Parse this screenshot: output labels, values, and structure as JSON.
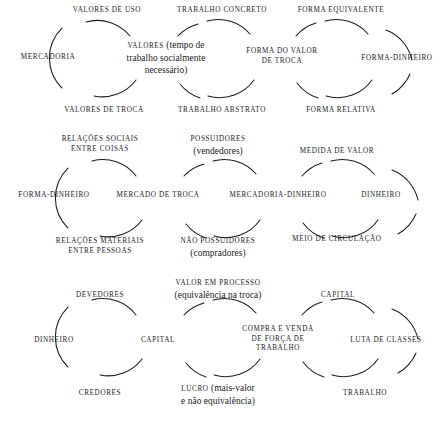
{
  "figure": {
    "language": "pt-BR",
    "background_color": "#ffffff",
    "ink_color": "#1a1a1a",
    "width": 441,
    "height": 438
  },
  "nodes": [
    {
      "id": "n-valores-de-uso",
      "style": "caps",
      "lines": [
        "Valores de uso"
      ],
      "x": 107,
      "y": 11
    },
    {
      "id": "n-trabalho-concreto",
      "style": "caps",
      "lines": [
        "Trabalho concreto"
      ],
      "x": 222,
      "y": 11
    },
    {
      "id": "n-forma-equivalente",
      "style": "caps",
      "lines": [
        "Forma equivalente"
      ],
      "x": 341,
      "y": 11
    },
    {
      "id": "n-mercadoria",
      "style": "caps",
      "lines": [
        "Mercadoria"
      ],
      "x": 48,
      "y": 58
    },
    {
      "id": "n-valores-tempo",
      "style": "mix",
      "lines_rich": [
        [
          {
            "t": "Valores",
            "sc": true
          },
          {
            "t": " (tempo de",
            "sc": false
          }
        ],
        [
          {
            "t": "trabalho socialmente",
            "sc": false
          }
        ],
        [
          {
            "t": "necessário)",
            "sc": false
          }
        ]
      ],
      "x": 166,
      "y": 58
    },
    {
      "id": "n-forma-do-valor-de-troca",
      "style": "caps",
      "lines": [
        "Forma do valor",
        "de troca"
      ],
      "x": 282,
      "y": 56
    },
    {
      "id": "n-forma-dinheiro-1",
      "style": "caps",
      "lines": [
        "Forma-dinheiro"
      ],
      "x": 397,
      "y": 59
    },
    {
      "id": "n-valores-de-troca",
      "style": "caps",
      "lines": [
        "Valores de troca"
      ],
      "x": 104,
      "y": 111
    },
    {
      "id": "n-trabalho-abstrato",
      "style": "caps",
      "lines": [
        "Trabalho abstrato"
      ],
      "x": 222,
      "y": 111
    },
    {
      "id": "n-forma-relativa",
      "style": "caps",
      "lines": [
        "Forma relativa"
      ],
      "x": 341,
      "y": 111
    },
    {
      "id": "n-relacoes-sociais",
      "style": "caps",
      "lines": [
        "Relações sociais",
        "entre coisas"
      ],
      "x": 100,
      "y": 144
    },
    {
      "id": "n-possuidores",
      "style": "mix",
      "lines_rich": [
        [
          {
            "t": "Possuidores",
            "sc": true
          }
        ],
        [
          {
            "t": "(vendedores)",
            "sc": false
          }
        ]
      ],
      "x": 218,
      "y": 144
    },
    {
      "id": "n-medida-de-valor",
      "style": "caps",
      "lines": [
        "Medida de valor"
      ],
      "x": 337,
      "y": 152
    },
    {
      "id": "n-forma-dinheiro-2",
      "style": "caps",
      "lines": [
        "Forma-dinheiro"
      ],
      "x": 54,
      "y": 196
    },
    {
      "id": "n-mercado-de-troca",
      "style": "caps",
      "lines": [
        "Mercado de troca"
      ],
      "x": 158,
      "y": 196
    },
    {
      "id": "n-mercadoria-dinheiro",
      "style": "caps",
      "lines": [
        "Mercadoria-dinheiro"
      ],
      "x": 278,
      "y": 196
    },
    {
      "id": "n-dinheiro-1",
      "style": "caps",
      "lines": [
        "Dinheiro"
      ],
      "x": 381,
      "y": 196
    },
    {
      "id": "n-relacoes-materiais",
      "style": "caps",
      "lines": [
        "Relações materiais",
        "entre pessoas"
      ],
      "x": 100,
      "y": 246
    },
    {
      "id": "n-nao-possuidores",
      "style": "mix",
      "lines_rich": [
        [
          {
            "t": "Não possuidores",
            "sc": true
          }
        ],
        [
          {
            "t": "(compradores)",
            "sc": false
          }
        ]
      ],
      "x": 218,
      "y": 246
    },
    {
      "id": "n-meio-de-circulacao",
      "style": "caps",
      "lines": [
        "Meio de circulação"
      ],
      "x": 337,
      "y": 240
    },
    {
      "id": "n-valor-em-processo",
      "style": "mix",
      "lines_rich": [
        [
          {
            "t": "Valor em processo",
            "sc": true
          }
        ],
        [
          {
            "t": "(equivalência na troca)",
            "sc": false
          }
        ]
      ],
      "x": 218,
      "y": 288
    },
    {
      "id": "n-devedores",
      "style": "caps",
      "lines": [
        "Devedores"
      ],
      "x": 100,
      "y": 296
    },
    {
      "id": "n-capital-top",
      "style": "caps",
      "lines": [
        "Capital"
      ],
      "x": 338,
      "y": 296
    },
    {
      "id": "n-dinheiro-2",
      "style": "caps",
      "lines": [
        "Dinheiro"
      ],
      "x": 54,
      "y": 341
    },
    {
      "id": "n-capital-mid",
      "style": "caps",
      "lines": [
        "Capital"
      ],
      "x": 158,
      "y": 341
    },
    {
      "id": "n-compra-e-venda",
      "style": "caps",
      "lines": [
        "Compra e venda",
        "de força de",
        "trabalho"
      ],
      "x": 278,
      "y": 339
    },
    {
      "id": "n-luta-de-classes",
      "style": "caps",
      "lines": [
        "Luta de classes"
      ],
      "x": 386,
      "y": 341
    },
    {
      "id": "n-credores",
      "style": "caps",
      "lines": [
        "Credores"
      ],
      "x": 100,
      "y": 394
    },
    {
      "id": "n-lucro",
      "style": "mix",
      "lines_rich": [
        [
          {
            "t": "Lucro",
            "sc": true
          },
          {
            "t": " (mais-valor",
            "sc": false
          }
        ],
        [
          {
            "t": "e não equivalência)",
            "sc": false
          }
        ]
      ],
      "x": 218,
      "y": 394
    },
    {
      "id": "n-trabalho",
      "style": "caps",
      "lines": [
        "Trabalho"
      ],
      "x": 365,
      "y": 394
    }
  ],
  "arcs": {
    "stroke_color": "#1a1a1a",
    "stroke_width": 1.05,
    "paths": [
      "M 62 88 A 42 42 0 0 1 62 28",
      "M 86 22 A 42 42 0 0 1 130 36",
      "M 136 80 A 42 42 0 0 1 94 96",
      "M 178 36 A 42 42 0 0 1 198 24",
      "M 207 21 A 42 42 0 0 1 250 34",
      "M 254 80 A 42 42 0 0 1 208 96",
      "M 200 98 A 42 42 0 0 1 180 84",
      "M 296 36 A 42 42 0 0 1 316 23",
      "M 325 21 A 42 42 0 0 1 368 34",
      "M 372 80 A 42 42 0 0 1 326 96",
      "M 318 98 A 42 42 0 0 1 297 83",
      "M 386 30 A 42 42 0 0 1 412 60",
      "M 410 74 A 42 42 0 0 1 392 94",
      "M 68 228 A 42 42 0 0 1 68 168",
      "M 92 161 A 42 42 0 0 1 136 176",
      "M 142 220 A 42 42 0 0 1 100 236",
      "M 184 176 A 42 42 0 0 1 204 164",
      "M 213 161 A 42 42 0 0 1 256 174",
      "M 260 220 A 42 42 0 0 1 214 236",
      "M 206 238 A 42 42 0 0 1 186 224",
      "M 302 176 A 42 42 0 0 1 322 163",
      "M 331 161 A 42 42 0 0 1 374 174",
      "M 378 220 A 42 42 0 0 1 332 236",
      "M 324 238 A 42 42 0 0 1 303 223",
      "M 392 170 A 42 42 0 0 1 418 200",
      "M 416 214 A 42 42 0 0 1 398 234",
      "M 68 367 A 42 42 0 0 1 68 307",
      "M 92 300 A 42 42 0 0 1 136 315",
      "M 142 359 A 42 42 0 0 1 100 375",
      "M 184 315 A 42 42 0 0 1 204 303",
      "M 213 300 A 42 42 0 0 1 256 313",
      "M 260 359 A 42 42 0 0 1 214 375",
      "M 206 377 A 42 42 0 0 1 186 363",
      "M 302 315 A 42 42 0 0 1 322 302",
      "M 331 300 A 42 42 0 0 1 374 313",
      "M 378 359 A 42 42 0 0 1 332 375",
      "M 324 377 A 42 42 0 0 1 303 362",
      "M 392 309 A 42 42 0 0 1 418 339",
      "M 416 353 A 42 42 0 0 1 398 373"
    ]
  }
}
